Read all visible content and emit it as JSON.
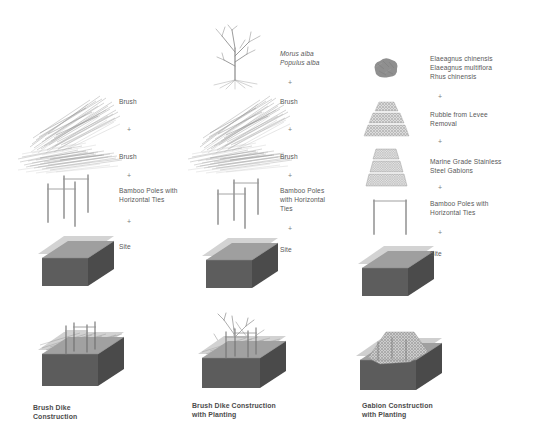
{
  "diagram": {
    "background_color": "#ffffff",
    "text_color": "#585858",
    "plus_symbol": "+",
    "site_block": {
      "top_plane_color": "#cfcfcf",
      "front_face_color": "#5f5f5f",
      "side_face_color": "#4e4e4e",
      "top_face_color": "#6e6e6e"
    },
    "columns": [
      {
        "id": "brush-dike-construction",
        "caption": "Brush Dike\nConstruction",
        "components": [
          {
            "id": "brush-upper",
            "label": "Brush",
            "icon": "brush-bundle-icon"
          },
          {
            "id": "brush-lower",
            "label": "Brush",
            "icon": "brush-mat-icon"
          },
          {
            "id": "bamboo-poles",
            "label": "Bamboo Poles with\nHorizontal Ties",
            "icon": "bamboo-poles-icon"
          },
          {
            "id": "site",
            "label": "Site",
            "icon": "site-block-icon"
          }
        ],
        "assembly_icon": "brush-dike-assembly-icon"
      },
      {
        "id": "brush-dike-construction-with-planting",
        "caption": "Brush Dike Construction\nwith Planting",
        "components": [
          {
            "id": "species",
            "label": "Morus alba\nPopulus alba",
            "icon": "bare-tree-icon",
            "italic": true
          },
          {
            "id": "brush-upper",
            "label": "Brush",
            "icon": "brush-bundle-icon"
          },
          {
            "id": "brush-lower",
            "label": "Brush",
            "icon": "brush-mat-icon"
          },
          {
            "id": "bamboo-poles",
            "label": "Bamboo Poles\nwith Horizontal\nTies",
            "icon": "bamboo-poles-icon"
          },
          {
            "id": "site",
            "label": "Site",
            "icon": "site-block-icon"
          }
        ],
        "assembly_icon": "brush-dike-planting-assembly-icon"
      },
      {
        "id": "gabion-construction-with-planting",
        "caption": "Gabion Construction\nwith Planting",
        "components": [
          {
            "id": "species",
            "label": "Elaeagnus chinensis\nElaeagnus multiflora\nRhus chinensis",
            "icon": "shrub-icon"
          },
          {
            "id": "rubble",
            "label": "Rubble from Levee\nRemoval",
            "icon": "rubble-pile-icon"
          },
          {
            "id": "gabions",
            "label": "Marine Grade Stainless\nSteel Gabions",
            "icon": "gabion-basket-icon"
          },
          {
            "id": "bamboo-poles",
            "label": "Bamboo Poles with\nHorizontal Ties",
            "icon": "bamboo-poles-pair-icon"
          },
          {
            "id": "site",
            "label": "Site",
            "icon": "site-block-icon"
          }
        ],
        "assembly_icon": "gabion-planting-assembly-icon"
      }
    ]
  }
}
